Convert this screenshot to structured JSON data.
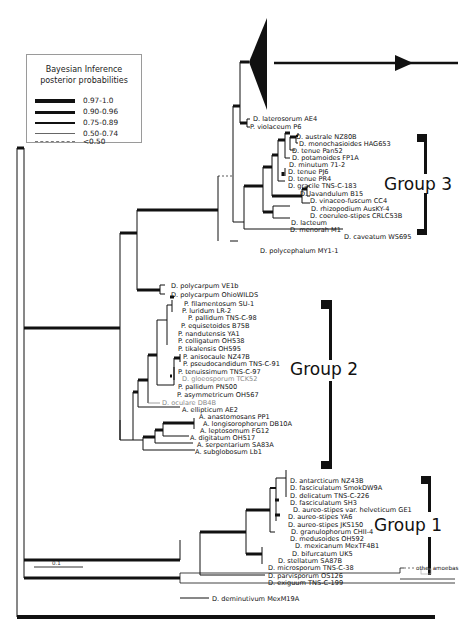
{
  "figure": {
    "type": "phylogenetic-tree",
    "legend": {
      "title_line1": "Bayesian Inference",
      "title_line2": "posterior probabilities",
      "entries": [
        {
          "label": "0.97-1.0",
          "line": "thickest"
        },
        {
          "label": "0.90-0.96",
          "line": "thick"
        },
        {
          "label": "0.75-0.89",
          "line": "medium"
        },
        {
          "label": "0.50-0.74",
          "line": "thin"
        },
        {
          "label": "<0.50",
          "line": "dashed"
        }
      ]
    },
    "scale_bar": {
      "label": "0.1"
    },
    "groups": [
      {
        "label": "Group 3"
      },
      {
        "label": "Group 2"
      },
      {
        "label": "Group 1"
      }
    ],
    "outgroup_label": "other amoebas",
    "taxa": {
      "g3": [
        "D. laterosorum AE4",
        "P. violaceum P6",
        "D. australe NZ80B",
        "D. monochasioides HAG653",
        "D. tenue Pan52",
        "D. potamoides FP1A",
        "D. minutum 71-2",
        "D. tenue PJ6",
        "D. tenue PR4",
        "D. gracile TNS-C-183",
        "D. lavandulum B15",
        "D. vinaceo-fuscum CC4",
        "D. rhizopodium AusKY-4",
        "D. coeruleo-stipes CRLC53B",
        "D. lacteum",
        "D. menorah M1",
        "D. caveatum WS695",
        "D. polycephalum MY1-1"
      ],
      "g2": [
        "D. polycarpum VE1b",
        "D. polycarpum OhioWILDS",
        "P. filamentosum SU-1",
        "P. luridum LR-2",
        "P. pallidum TNS-C-98",
        "P. equisetoides B75B",
        "P. nandutensis YA1",
        "P. colligatum OH538",
        "P. tikalensis OH595",
        "P. anisocaule NZ47B",
        "P. pseudocandidum TNS-C-91",
        "P. tenuissimum TNS-C-97",
        "D. gloeosporum TCK52",
        "P. pallidum PN500",
        "P. asymmetricum OH567",
        "D. oculare DB4B",
        "A. ellipticum AE2",
        "A. anastomosans PP1",
        "A. longisorophorum DB10A",
        "A. leptosomum FG12",
        "A. digitatum OH517",
        "A. serpentarium SA83A",
        "A. subglobosum Lb1"
      ],
      "g1": [
        "D. antarcticum NZ43B",
        "D. fasciculatum SmokDW9A",
        "D. delicatum TNS-C-226",
        "D. fasciculatum SH3",
        "D. aureo-stipes var. helveticum GE1",
        "D. aureo-stipes YA6",
        "D. aureo-stipes JKS150",
        "D. granulophorum CHII-4",
        "D. medusoides OH592",
        "D. mexicanum MexTF4B1",
        "D. bifurcatum UK5",
        "D. stellatum SA87B",
        "D. microsporum TNS-C-38",
        "D. parvisporum OS126",
        "D. exiguum TNS-C-199",
        "D. deminutivum MexM19A"
      ]
    },
    "colors": {
      "branch": "#111111",
      "grey_taxon": "#8a8a8a",
      "legend_border": "#9a9a9a"
    }
  }
}
